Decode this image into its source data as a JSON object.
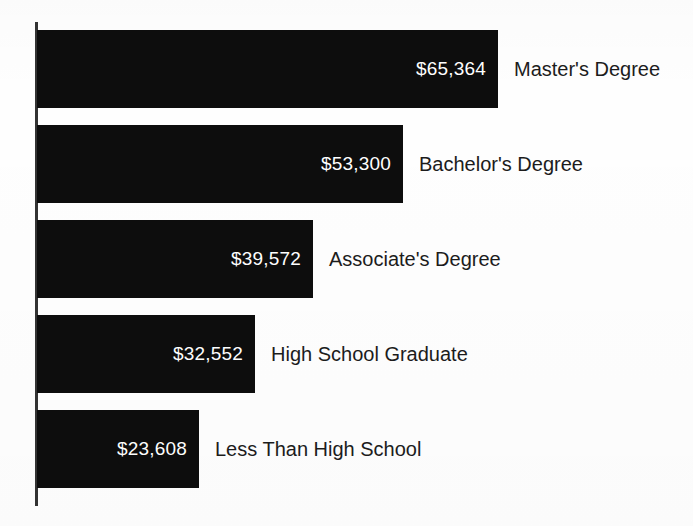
{
  "chart_data": {
    "type": "bar",
    "orientation": "horizontal",
    "title": "",
    "subtitle": "",
    "xlabel": "",
    "ylabel": "",
    "grid": false,
    "legend": null,
    "axis": {
      "value_axis_visible": false,
      "category_axis_visible": true,
      "category_axis_color": "#333333"
    },
    "xlim": [
      0,
      70000
    ],
    "categories": [
      "Master's Degree",
      "Bachelor's Degree",
      "Associate's Degree",
      "High School Graduate",
      "Less Than High School"
    ],
    "values": [
      65364,
      53300,
      39572,
      32552,
      23608
    ],
    "value_labels": [
      "$65,364",
      "$53,300",
      "$39,572",
      "$32,552",
      "$23,608"
    ],
    "value_label_position": "inside-end",
    "value_label_color": "#ffffff",
    "bar_color": "#0d0d0d",
    "background_color": "#ffffff",
    "category_label_color": "#1c1c1c",
    "category_label_position": "outside-end"
  },
  "bars": [
    {
      "category": "Master's Degree",
      "value": 65364,
      "value_label": "$65,364",
      "top": 30,
      "width": 461
    },
    {
      "category": "Bachelor's Degree",
      "value": 53300,
      "value_label": "$53,300",
      "top": 125,
      "width": 366
    },
    {
      "category": "Associate's Degree",
      "value": 39572,
      "value_label": "$39,572",
      "top": 220,
      "width": 276
    },
    {
      "category": "High School Graduate",
      "value": 32552,
      "value_label": "$32,552",
      "top": 315,
      "width": 218
    },
    {
      "category": "Less Than High School",
      "value": 23608,
      "value_label": "$23,608",
      "top": 410,
      "width": 162
    }
  ]
}
